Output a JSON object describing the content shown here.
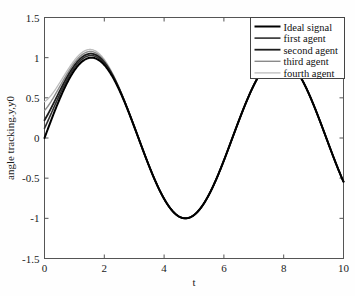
{
  "chart_data": {
    "type": "line",
    "title": "",
    "xlabel": "t",
    "ylabel": "angle tracking.y,y0",
    "xlim": [
      0,
      10
    ],
    "ylim": [
      -1.5,
      1.5
    ],
    "xticks": [
      0,
      2,
      4,
      6,
      8,
      10
    ],
    "xtick_labels": [
      "0",
      "2",
      "4",
      "6",
      "8",
      "10"
    ],
    "yticks": [
      1.5,
      1,
      0.5,
      0,
      -0.5,
      -1,
      -1.5
    ],
    "ytick_labels": [
      "1.5",
      "1",
      "0.5",
      "0",
      "-0.5",
      "-1",
      "-1.5"
    ],
    "grid": false,
    "legend_position": "upper right",
    "series": [
      {
        "name": "Ideal signal",
        "color": "#000000",
        "width": 2.0,
        "initial_value": 0.0,
        "description": "reference sine wave y0 = sin(t)"
      },
      {
        "name": "first agent",
        "color": "#2e2e2e",
        "width": 1.6,
        "initial_value": 0.12,
        "description": "agent output converging to sin(t)"
      },
      {
        "name": "second agent",
        "color": "#1c1c1c",
        "width": 1.8,
        "initial_value": 0.22,
        "description": "agent output converging to sin(t)"
      },
      {
        "name": "third agent",
        "color": "#8a8a8a",
        "width": 1.4,
        "initial_value": 0.34,
        "description": "agent output converging to sin(t)"
      },
      {
        "name": "fourth agent",
        "color": "#bdbdbd",
        "width": 1.3,
        "initial_value": 0.45,
        "description": "agent output converging to sin(t)"
      }
    ],
    "reference_points": [
      {
        "t": 0.0,
        "y": 0.0
      },
      {
        "t": 1.57,
        "y": 1.0
      },
      {
        "t": 3.14,
        "y": 0.0
      },
      {
        "t": 4.71,
        "y": -1.0
      },
      {
        "t": 6.28,
        "y": 0.0
      },
      {
        "t": 7.85,
        "y": 1.0
      },
      {
        "t": 9.42,
        "y": 0.0
      },
      {
        "t": 10.0,
        "y": -0.54
      }
    ]
  },
  "legend": {
    "items": [
      {
        "label": "Ideal signal",
        "color": "#000000"
      },
      {
        "label": "first agent",
        "color": "#2e2e2e"
      },
      {
        "label": "second agent",
        "color": "#1c1c1c"
      },
      {
        "label": "third agent",
        "color": "#8a8a8a"
      },
      {
        "label": "fourth agent",
        "color": "#bdbdbd"
      }
    ]
  },
  "axes": {
    "x_title": "t",
    "y_title": "angle tracking.y,y0"
  }
}
